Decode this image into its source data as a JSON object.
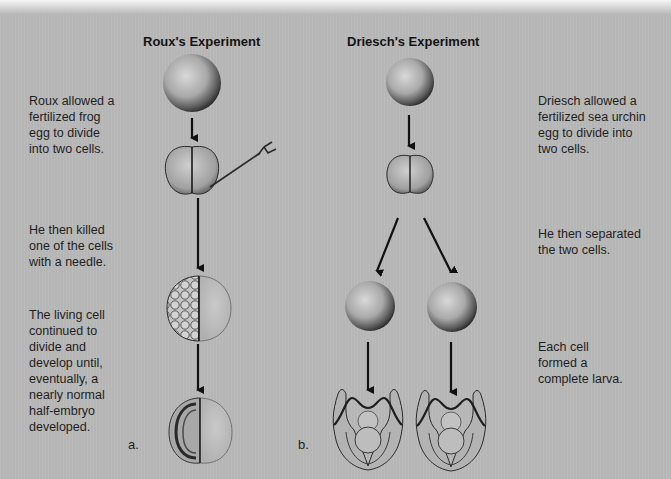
{
  "figure": {
    "panel_a": {
      "title": "Roux's Experiment",
      "label": "a.",
      "steps": [
        {
          "caption": "Roux allowed a\nfertilized frog\negg to divide\ninto two cells."
        },
        {
          "caption": "He then killed\none of the cells\nwith a needle."
        },
        {
          "caption": "The living cell\ncontinued to\ndivide and\ndevelop until,\neventually, a\nnearly normal\nhalf-embryo\ndeveloped."
        }
      ],
      "stages": [
        "fertilized-egg",
        "two-cell-stage-with-needle",
        "half-divided-embryo",
        "half-embryo"
      ]
    },
    "panel_b": {
      "title": "Driesch's Experiment",
      "label": "b.",
      "steps": [
        {
          "caption": "Driesch allowed a\nfertilized sea urchin\negg to divide into\ntwo cells."
        },
        {
          "caption": "He then separated\nthe two cells."
        },
        {
          "caption": "Each cell\nformed a\ncomplete larva."
        }
      ],
      "stages": [
        "fertilized-egg",
        "two-cell-stage",
        "separated-cells",
        "complete-larvae"
      ]
    },
    "colors": {
      "background": "#b9b9b9",
      "text": "#1f1f1f",
      "arrow": "#111111"
    }
  }
}
